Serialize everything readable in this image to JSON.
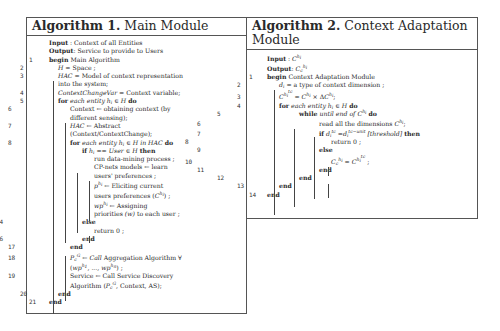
{
  "algorithm1": {
    "title_bold": "Algorithm 1.",
    "title_rest": " Main Module",
    "input_label": "Input",
    "input_value": " : Context of all Entities",
    "output_label": "Output",
    "output_value": ": Service to provide to Users",
    "lines": [
      {
        "n": "1",
        "text": "begin Main Algorithm"
      },
      {
        "n": "2",
        "text": "H = Space ;"
      },
      {
        "n": "3",
        "text": "HAC = Model of context representation into the system;"
      },
      {
        "n": "4",
        "text": "ContextChangeVar = Context variable;"
      },
      {
        "n": "5",
        "text": "for each entity h_i ∈ H do"
      },
      {
        "n": "6",
        "text": "Context ← obtaining context (by different sensing);"
      },
      {
        "n": "7",
        "text": "HAC ← Abstract (Context/ContextChange);"
      },
      {
        "n": "8",
        "text": "for each entity h_i ∈ H in HAC do"
      },
      {
        "n": "9",
        "text": "if h_i == User ∈ H then"
      },
      {
        "n": "10",
        "text": "run data-mining process ;"
      },
      {
        "n": "11",
        "text": "CP-nets models ← learn users' preferences ;"
      },
      {
        "n": "12",
        "text": "p^{h_i} ← Eliciting current users preferences (C^{h_i}) ;"
      },
      {
        "n": "13",
        "text": "wp^{h_i} ← Assigning priorities (w) to each user ;"
      },
      {
        "n": "14",
        "text": "else"
      },
      {
        "n": "15",
        "text": "return 0 ;"
      },
      {
        "n": "16",
        "text": "end"
      },
      {
        "n": "17",
        "text": "end"
      },
      {
        "n": "18",
        "text": "P_c^G ← Call Aggregation Algorithm ∀ (wp^{h_1}, ..., wp^{h_n}) ;"
      },
      {
        "n": "19",
        "text": "Service ← Call Service Discovery Algorithm (P_c^G, Context, AS);"
      },
      {
        "n": "20",
        "text": "end"
      },
      {
        "n": "21",
        "text": "end"
      }
    ]
  },
  "algorithm2": {
    "title_bold": "Algorithm 2.",
    "title_rest": " Context Adaptation Module",
    "input_label": "Input",
    "input_value": " : C^{h_i}",
    "output_label": "Output",
    "output_value": ": C_c^{h_i}",
    "lines": [
      {
        "n": "1",
        "text": "begin Context Adaptation Module"
      },
      {
        "n": "2",
        "text": "d_i = a type of context dimension ;"
      },
      {
        "n": "3",
        "text": "C^{h_i^{tc}} = C^{h_i} × ΔC^{h_i};"
      },
      {
        "n": "4",
        "text": "for each entity h_i ∈ H do"
      },
      {
        "n": "5",
        "text": "while until end of C^{h_i} do"
      },
      {
        "n": "6",
        "text": "read all the dimensions C^{h_i};"
      },
      {
        "n": "7",
        "text": "if d_i^{tc} = d_i^{tc-unit} [threshold] then"
      },
      {
        "n": "8",
        "text": "return 0 ;"
      },
      {
        "n": "9",
        "text": "else"
      },
      {
        "n": "10",
        "text": "C_c^{h_i} = C^{h_i^{tc}} ;"
      },
      {
        "n": "11",
        "text": "end"
      },
      {
        "n": "12",
        "text": "end"
      },
      {
        "n": "13",
        "text": "end"
      },
      {
        "n": "14",
        "text": "end"
      }
    ]
  }
}
